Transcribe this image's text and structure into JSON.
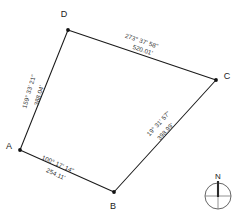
{
  "diagram": {
    "type": "boundary-survey-plat",
    "units": "feet",
    "angle_format": "degrees-minutes-seconds",
    "vertices": [
      {
        "id": "A",
        "label": "A",
        "x": 20,
        "y": 150,
        "label_x": 9,
        "label_y": 149
      },
      {
        "id": "B",
        "label": "B",
        "x": 114,
        "y": 192,
        "label_x": 113,
        "label_y": 209
      },
      {
        "id": "C",
        "label": "C",
        "x": 216,
        "y": 80,
        "label_x": 227,
        "label_y": 79
      },
      {
        "id": "D",
        "label": "D",
        "x": 68,
        "y": 30,
        "label_x": 64,
        "label_y": 17
      }
    ],
    "edges": [
      {
        "id": "edge-AD",
        "from": "A",
        "to": "D",
        "bearing": "159° 33' 21\"",
        "distance": "388.04'",
        "bearing_x": 31,
        "bearing_y": 92,
        "distance_x": 41,
        "distance_y": 96,
        "rotation": -74
      },
      {
        "id": "edge-DC",
        "from": "D",
        "to": "C",
        "bearing": "273° 37' 58\"",
        "distance": "520.01'",
        "bearing_x": 141,
        "bearing_y": 43,
        "distance_x": 142,
        "distance_y": 52,
        "rotation": 18.6
      },
      {
        "id": "edge-CB",
        "from": "C",
        "to": "B",
        "bearing": "19° 31' 57\"",
        "distance": "398.99'",
        "bearing_x": 160,
        "bearing_y": 125,
        "distance_x": 167,
        "distance_y": 133,
        "rotation": -47.6
      },
      {
        "id": "edge-AB",
        "from": "A",
        "to": "B",
        "bearing": "100° 17' 14\"",
        "distance": "254.11'",
        "bearing_x": 57,
        "bearing_y": 166,
        "distance_x": 55,
        "distance_y": 176,
        "rotation": 24.1
      }
    ]
  },
  "compass": {
    "name": "north-arrow",
    "north_label": "N",
    "center_x": 218,
    "center_y": 196,
    "radius": 13,
    "label_x": 218,
    "label_y": 179
  },
  "colors": {
    "line": "#1a1a1a",
    "text": "#333333",
    "compass_ring": "#555555",
    "background": "#ffffff"
  }
}
